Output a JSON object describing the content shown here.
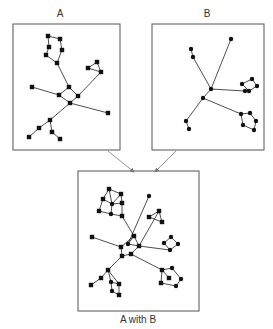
{
  "labels": {
    "a": "A",
    "b": "B",
    "combined": "A with B"
  },
  "colors": {
    "frame": "#555555",
    "edge": "#222222",
    "node": "#111111",
    "arrow": "#777777"
  },
  "graphs": {
    "a": {
      "node_shape": "square",
      "nodes": [
        [
          48,
          36
        ],
        [
          60,
          39
        ],
        [
          49,
          47
        ],
        [
          62,
          50
        ],
        [
          46,
          55
        ],
        [
          57,
          63
        ],
        [
          69,
          87
        ],
        [
          59,
          95
        ],
        [
          78,
          96
        ],
        [
          70,
          103
        ],
        [
          32,
          87
        ],
        [
          108,
          113
        ],
        [
          97,
          62
        ],
        [
          88,
          68
        ],
        [
          101,
          72
        ],
        [
          50,
          120
        ],
        [
          39,
          128
        ],
        [
          29,
          137
        ],
        [
          52,
          132
        ],
        [
          60,
          139
        ]
      ],
      "edges": [
        [
          0,
          1
        ],
        [
          0,
          2
        ],
        [
          2,
          4
        ],
        [
          4,
          5
        ],
        [
          1,
          3
        ],
        [
          3,
          5
        ],
        [
          5,
          6
        ],
        [
          6,
          7
        ],
        [
          6,
          8
        ],
        [
          7,
          9
        ],
        [
          8,
          9
        ],
        [
          7,
          10
        ],
        [
          9,
          11
        ],
        [
          8,
          14
        ],
        [
          12,
          13
        ],
        [
          12,
          14
        ],
        [
          13,
          14
        ],
        [
          9,
          15
        ],
        [
          15,
          16
        ],
        [
          16,
          17
        ],
        [
          15,
          18
        ],
        [
          18,
          19
        ]
      ]
    },
    "b": {
      "node_shape": "circle",
      "nodes": [
        [
          231,
          39
        ],
        [
          191,
          49
        ],
        [
          193,
          57
        ],
        [
          211,
          89
        ],
        [
          203,
          98
        ],
        [
          242,
          84
        ],
        [
          252,
          79
        ],
        [
          257,
          86
        ],
        [
          249,
          91
        ],
        [
          245,
          91
        ],
        [
          241,
          114
        ],
        [
          250,
          113
        ],
        [
          256,
          121
        ],
        [
          254,
          130
        ],
        [
          243,
          125
        ],
        [
          186,
          121
        ],
        [
          189,
          129
        ]
      ],
      "edges": [
        [
          0,
          3
        ],
        [
          1,
          2
        ],
        [
          2,
          3
        ],
        [
          3,
          4
        ],
        [
          3,
          9
        ],
        [
          5,
          6
        ],
        [
          6,
          7
        ],
        [
          7,
          8
        ],
        [
          8,
          5
        ],
        [
          4,
          10
        ],
        [
          10,
          11
        ],
        [
          11,
          12
        ],
        [
          12,
          13
        ],
        [
          13,
          14
        ],
        [
          14,
          10
        ],
        [
          4,
          15
        ],
        [
          15,
          16
        ]
      ]
    },
    "combined": {
      "nodes": [
        [
          109,
          189,
          "s"
        ],
        [
          121,
          194,
          "s"
        ],
        [
          103,
          199,
          "s"
        ],
        [
          112,
          204,
          "c"
        ],
        [
          122,
          203,
          "s"
        ],
        [
          99,
          211,
          "s"
        ],
        [
          111,
          214,
          "c"
        ],
        [
          122,
          216,
          "s"
        ],
        [
          149,
          196,
          "c"
        ],
        [
          159,
          211,
          "s"
        ],
        [
          149,
          217,
          "s"
        ],
        [
          162,
          222,
          "s"
        ],
        [
          92,
          237,
          "s"
        ],
        [
          134,
          236,
          "s"
        ],
        [
          128,
          244,
          "c"
        ],
        [
          139,
          246,
          "s"
        ],
        [
          121,
          247,
          "s"
        ],
        [
          122,
          256,
          "s"
        ],
        [
          131,
          254,
          "s"
        ],
        [
          171,
          237,
          "c"
        ],
        [
          178,
          244,
          "c"
        ],
        [
          164,
          243,
          "c"
        ],
        [
          170,
          250,
          "c"
        ],
        [
          162,
          270,
          "s"
        ],
        [
          172,
          268,
          "c"
        ],
        [
          169,
          278,
          "s"
        ],
        [
          181,
          279,
          "c"
        ],
        [
          161,
          283,
          "s"
        ],
        [
          176,
          286,
          "c"
        ],
        [
          108,
          270,
          "s"
        ],
        [
          101,
          278,
          "s"
        ],
        [
          91,
          285,
          "s"
        ],
        [
          111,
          282,
          "c"
        ],
        [
          119,
          284,
          "s"
        ],
        [
          112,
          291,
          "c"
        ],
        [
          119,
          295,
          "s"
        ]
      ],
      "edges": [
        [
          0,
          1
        ],
        [
          0,
          2
        ],
        [
          2,
          5
        ],
        [
          5,
          6
        ],
        [
          1,
          4
        ],
        [
          4,
          7
        ],
        [
          6,
          7
        ],
        [
          0,
          3
        ],
        [
          3,
          4
        ],
        [
          3,
          6
        ],
        [
          2,
          3
        ],
        [
          3,
          1
        ],
        [
          7,
          13
        ],
        [
          8,
          14
        ],
        [
          13,
          14
        ],
        [
          13,
          15
        ],
        [
          14,
          15
        ],
        [
          16,
          12
        ],
        [
          16,
          13
        ],
        [
          16,
          17
        ],
        [
          17,
          18
        ],
        [
          18,
          15
        ],
        [
          15,
          9
        ],
        [
          9,
          10
        ],
        [
          10,
          11
        ],
        [
          11,
          9
        ],
        [
          15,
          22
        ],
        [
          19,
          20
        ],
        [
          20,
          22
        ],
        [
          22,
          21
        ],
        [
          21,
          19
        ],
        [
          18,
          23
        ],
        [
          23,
          24
        ],
        [
          24,
          26
        ],
        [
          26,
          28
        ],
        [
          28,
          27
        ],
        [
          27,
          23
        ],
        [
          23,
          25
        ],
        [
          17,
          29
        ],
        [
          29,
          30
        ],
        [
          30,
          31
        ],
        [
          29,
          32
        ],
        [
          32,
          33
        ],
        [
          33,
          35
        ],
        [
          35,
          34
        ],
        [
          34,
          32
        ],
        [
          29,
          33
        ]
      ]
    }
  },
  "frames": {
    "a": [
      13,
      24,
      107,
      126
    ],
    "b": [
      152,
      24,
      112,
      126
    ],
    "combined": [
      78,
      171,
      121,
      140
    ]
  },
  "arrows": [
    {
      "from": [
        108,
        151
      ],
      "to": [
        134,
        172
      ]
    },
    {
      "from": [
        176,
        151
      ],
      "to": [
        155,
        172
      ]
    }
  ]
}
